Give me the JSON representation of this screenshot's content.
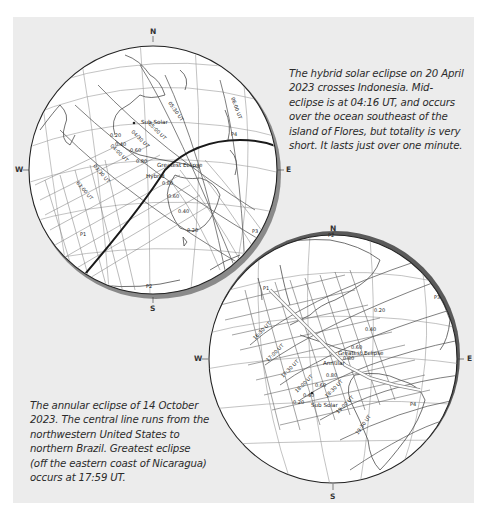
{
  "captions": {
    "hybrid": "The hybrid solar eclipse on 20 April 2023 crosses Indonesia. Mid-eclipse is at 04:16 UT, and occurs over the ocean southeast of the island of Flores, but totality is very short. It lasts just over one minute.",
    "annular": "The annular eclipse of 14 October 2023. The central line runs from the northwestern United States to northern Brazil. Greatest eclipse (off the eastern coast of Nicaragua) occurs at 17:59 UT."
  },
  "compass": {
    "n": "N",
    "s": "S",
    "w": "W",
    "e": "E"
  },
  "colors": {
    "panel": "#ececec",
    "globe_fill": "#ffffff",
    "grid": "#8a8a8a",
    "path": "#555555",
    "central_line": "#1a1a1a",
    "shadow_rim": "#7a7a7a"
  },
  "globe_hybrid": {
    "title": "Hybrid solar eclipse 20 April 2023",
    "time_labels": [
      "03:00 UT",
      "03:30 UT",
      "04:00 UT",
      "04:30 UT",
      "05:00 UT",
      "05:30 UT",
      "06:00 UT"
    ],
    "magnitude_labels": [
      "0.20",
      "0.40",
      "0.60",
      "0.80",
      "0.80",
      "0.60",
      "0.40",
      "0.20"
    ],
    "markers": {
      "sub_solar": "Sub Solar",
      "greatest": "Greatest Eclipse",
      "type": "Hybrid",
      "p1": "P1",
      "p2": "P2",
      "p3": "P3",
      "p4": "P4"
    }
  },
  "globe_annular": {
    "title": "Annular solar eclipse 14 October 2023",
    "time_labels": [
      "16:30 UT",
      "17:00 UT",
      "17:30 UT",
      "18:00 UT",
      "18:30 UT",
      "19:00 UT",
      "19:30 UT"
    ],
    "magnitude_labels": [
      "0.20",
      "0.40",
      "0.60",
      "0.80",
      "0.80",
      "0.60",
      "0.40",
      "0.20"
    ],
    "markers": {
      "sub_solar": "Sub Solar",
      "greatest": "Greatest Eclipse",
      "type": "Annular",
      "p1": "P1",
      "p2": "P2",
      "p3": "P3",
      "p4": "P4"
    }
  }
}
